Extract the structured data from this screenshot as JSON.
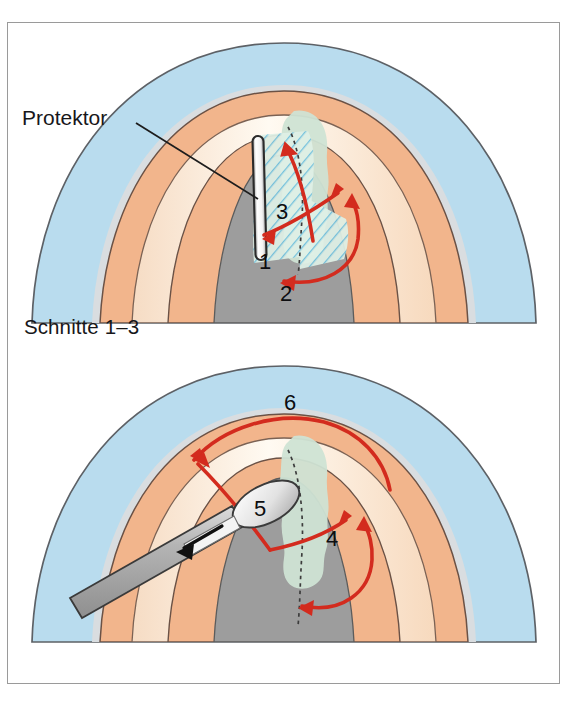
{
  "figure": {
    "background_color": "#ffffff",
    "frame_color": "#9a9a9a"
  },
  "palette": {
    "skin_outer_blue": "#b9dcee",
    "skin_edge_gray": "#d9dde0",
    "nailfold_orange": "#f2b58c",
    "nailbed_cream": "#fdf0e0",
    "nail_center_gray": "#9d9d9d",
    "lesion_green": "#cfe3d4",
    "hatch_blue": "#6fc0de",
    "arrow_red": "#d32b1e",
    "outline_dark": "#4a4a4a",
    "instrument_gray": "#b2b2b2",
    "protector_white": "#fbfbfb",
    "text_black": "#17171a"
  },
  "panels": [
    {
      "id": "panel-top",
      "caption": "Schnitte 1–3",
      "callout": {
        "label": "Protektor",
        "target": "protector-instrument"
      },
      "instrument": "protector",
      "incision_numbers": [
        "1",
        "2",
        "3"
      ]
    },
    {
      "id": "panel-bottom",
      "caption": "Schnitte 4–6",
      "callout": null,
      "instrument": "elevator-raspatory",
      "incision_numbers": [
        "4",
        "5",
        "6"
      ]
    }
  ],
  "labels": {
    "protektor": "Protektor",
    "caption_top": "Schnitte 1–3",
    "caption_bottom": "Schnitte 4–6",
    "n1": "1",
    "n2": "2",
    "n3": "3",
    "n4": "4",
    "n5": "5",
    "n6": "6"
  }
}
